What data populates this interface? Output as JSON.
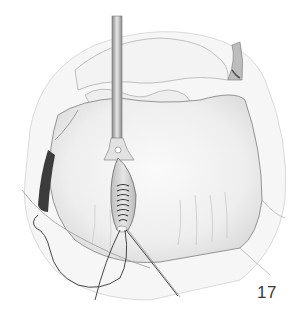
{
  "figure": {
    "number": "17",
    "style": "pencil-drawing"
  },
  "colors": {
    "background": "#ffffff",
    "tissue_fill": "#f1f1f1",
    "tissue_shade": "#d9d9d9",
    "outline": "#7a7a7a",
    "dark_shadow": "#3c3c3c",
    "suture": "#333333"
  }
}
